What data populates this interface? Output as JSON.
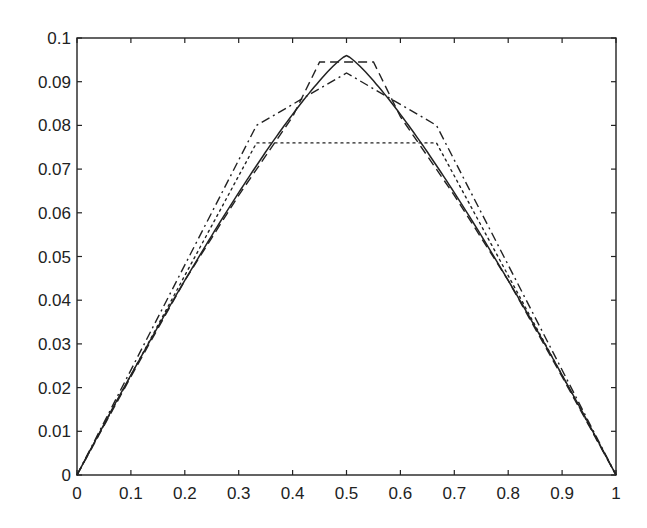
{
  "chart_data": {
    "type": "line",
    "title": "",
    "xlabel": "",
    "ylabel": "",
    "xlim": [
      0,
      1
    ],
    "ylim": [
      0,
      0.1
    ],
    "grid": false,
    "legend": null,
    "x_ticks": [
      "0",
      "0.1",
      "0.2",
      "0.3",
      "0.4",
      "0.5",
      "0.6",
      "0.7",
      "0.8",
      "0.9",
      "1"
    ],
    "y_ticks": [
      "0",
      "0.01",
      "0.02",
      "0.03",
      "0.04",
      "0.05",
      "0.06",
      "0.07",
      "0.08",
      "0.09",
      "0.1"
    ],
    "series": [
      {
        "name": "solid",
        "style": "solid",
        "description": "smooth curve, peak ~0.096 at x=0.5",
        "x": [
          0,
          0.05,
          0.1,
          0.15,
          0.2,
          0.25,
          0.3,
          0.35,
          0.4,
          0.45,
          0.5,
          0.55,
          0.6,
          0.65,
          0.7,
          0.75,
          0.8,
          0.85,
          0.9,
          0.95,
          1
        ],
        "y": [
          0,
          0.0115,
          0.0229,
          0.0338,
          0.0451,
          0.0556,
          0.0646,
          0.0731,
          0.081,
          0.0878,
          0.096,
          0.0878,
          0.081,
          0.0731,
          0.0646,
          0.0556,
          0.0451,
          0.0338,
          0.0229,
          0.0115,
          0
        ]
      },
      {
        "name": "dashed",
        "style": "dashed",
        "x": [
          0,
          0.1,
          0.2,
          0.3,
          0.4,
          0.45,
          0.55,
          0.6,
          0.7,
          0.8,
          0.9,
          1
        ],
        "y": [
          0,
          0.0225,
          0.0445,
          0.064,
          0.082,
          0.0945,
          0.0945,
          0.082,
          0.064,
          0.0445,
          0.0225,
          0
        ]
      },
      {
        "name": "dash-dot",
        "style": "dashdot",
        "x": [
          0,
          0.333,
          0.5,
          0.667,
          1
        ],
        "y": [
          0,
          0.08,
          0.092,
          0.08,
          0
        ]
      },
      {
        "name": "dotted",
        "style": "dotted",
        "x": [
          0,
          0.333,
          0.667,
          1
        ],
        "y": [
          0,
          0.076,
          0.076,
          0
        ]
      }
    ]
  }
}
